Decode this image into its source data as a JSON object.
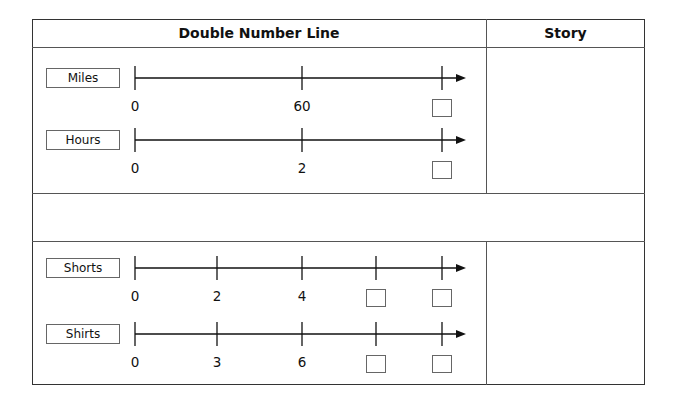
{
  "headers": {
    "left": "Double Number Line",
    "right": "Story"
  },
  "problems": [
    {
      "lines": [
        {
          "label": "Miles",
          "ticks": [
            "0",
            "60",
            ""
          ]
        },
        {
          "label": "Hours",
          "ticks": [
            "0",
            "2",
            ""
          ]
        }
      ]
    },
    {
      "lines": [
        {
          "label": "Shorts",
          "ticks": [
            "0",
            "2",
            "4",
            "",
            ""
          ]
        },
        {
          "label": "Shirts",
          "ticks": [
            "0",
            "3",
            "6",
            "",
            ""
          ]
        }
      ]
    }
  ]
}
